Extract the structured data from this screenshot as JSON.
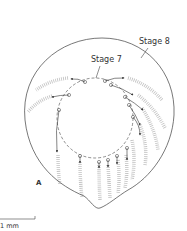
{
  "figure": {
    "panel_label": "A",
    "labels": {
      "outer": "Stage 8",
      "inner": "Stage 7"
    },
    "scale_bar": {
      "label": "1 mm"
    },
    "colors": {
      "outline": "#555555",
      "stipple": "#b8b8b8",
      "text": "#333333"
    },
    "markers_count": 16
  }
}
